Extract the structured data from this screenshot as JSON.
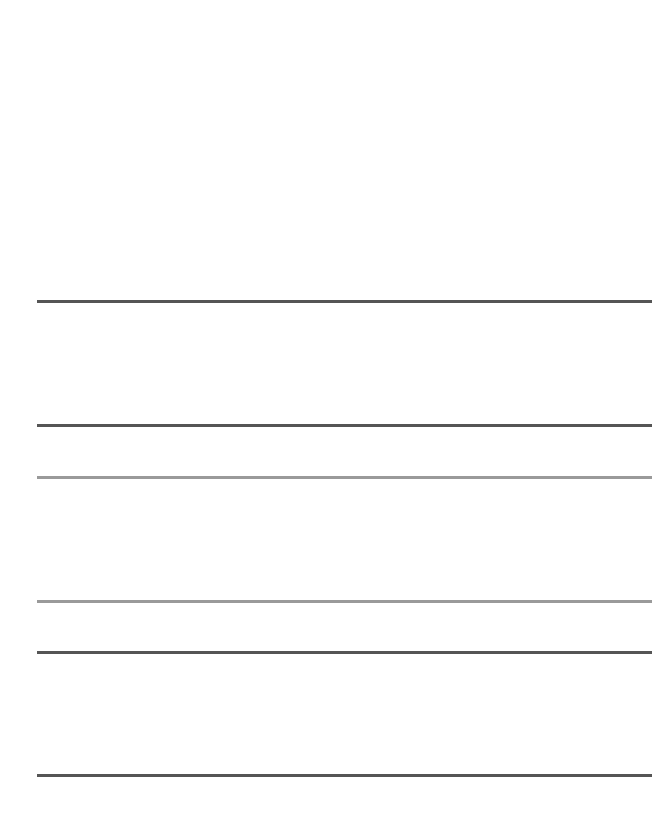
{
  "worksheet": {
    "type": "handwriting-practice-lines",
    "background": "#ffffff",
    "line_left": 37,
    "line_right": 652,
    "line_thickness": 3,
    "dash": {
      "length": 17,
      "gap": 17,
      "offset": 9
    },
    "groups": [
      {
        "name": "row-1",
        "color": "#555555",
        "lines": [
          {
            "role": "top-line",
            "style": "solid",
            "y": 300
          },
          {
            "role": "mid-line",
            "style": "dashed",
            "y": 362
          },
          {
            "role": "base-line",
            "style": "solid",
            "y": 424
          }
        ]
      },
      {
        "name": "row-2",
        "color": "#9a9a9a",
        "lines": [
          {
            "role": "top-line",
            "style": "solid",
            "y": 476
          },
          {
            "role": "mid-line",
            "style": "dashed",
            "y": 538
          },
          {
            "role": "base-line",
            "style": "solid",
            "y": 600
          }
        ]
      },
      {
        "name": "row-3",
        "color": "#555555",
        "lines": [
          {
            "role": "top-line",
            "style": "solid",
            "y": 651
          },
          {
            "role": "mid-line",
            "style": "dashed",
            "y": 713
          },
          {
            "role": "base-line",
            "style": "solid",
            "y": 774
          }
        ]
      }
    ]
  }
}
